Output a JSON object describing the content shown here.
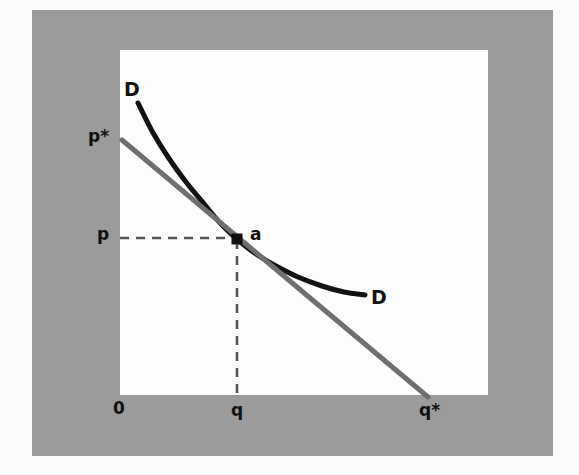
{
  "figure": {
    "kind": "economics-diagram",
    "colors": {
      "page_background": "#fcfcfc",
      "mat_gray": "#9b9b9b",
      "panel_white": "#fdfdfd",
      "demand_curve": "#121212",
      "tangent_line": "#6f6f6f",
      "dashed_guide": "#555555",
      "marker": "#111111",
      "label_text": "#111111"
    },
    "panel": {
      "left": 120,
      "top": 50,
      "width": 368,
      "height": 345
    },
    "mat": {
      "left": 32,
      "top": 10,
      "width": 521,
      "height": 446
    }
  },
  "labels": [
    {
      "name": "curve-label-top",
      "text": "D",
      "x": 124,
      "y": 80,
      "size": "lbl-lg"
    },
    {
      "name": "curve-label-bottom",
      "text": "D",
      "x": 371,
      "y": 288,
      "size": "lbl-lg"
    },
    {
      "name": "axis-label-p-star",
      "text": "p*",
      "x": 88,
      "y": 128,
      "size": "lbl-md"
    },
    {
      "name": "axis-label-p",
      "text": "p",
      "x": 97,
      "y": 226,
      "size": "lbl-md"
    },
    {
      "name": "point-label-a",
      "text": "a",
      "x": 250,
      "y": 226,
      "size": "lbl-md"
    },
    {
      "name": "axis-label-origin",
      "text": "0",
      "x": 113,
      "y": 400,
      "size": "lbl-md"
    },
    {
      "name": "axis-label-q",
      "text": "q",
      "x": 231,
      "y": 402,
      "size": "lbl-md"
    },
    {
      "name": "axis-label-q-star",
      "text": "q*",
      "x": 419,
      "y": 402,
      "size": "lbl-md"
    }
  ],
  "chart_data": {
    "type": "line",
    "title": "",
    "xlabel": "",
    "ylabel": "",
    "grid": false,
    "legend_position": "inline-endpoint-labels",
    "annotations": [
      {
        "label": "D",
        "role": "demand-curve-upper-end",
        "at": [
          138,
          103
        ]
      },
      {
        "label": "D",
        "role": "demand-curve-lower-end",
        "at": [
          365,
          295
        ]
      },
      {
        "label": "a",
        "role": "tangency-point",
        "at": [
          237,
          239
        ]
      },
      {
        "label": "p",
        "role": "price-at-tangency",
        "at": [
          120,
          237
        ]
      },
      {
        "label": "q",
        "role": "quantity-at-tangency",
        "at": [
          237,
          395
        ]
      },
      {
        "label": "p*",
        "role": "tangent-price-intercept",
        "at": [
          122,
          140
        ]
      },
      {
        "label": "q*",
        "role": "tangent-quantity-intercept",
        "at": [
          428,
          397
        ]
      },
      {
        "label": "0",
        "role": "origin",
        "at": [
          120,
          395
        ]
      }
    ],
    "series": [
      {
        "name": "D",
        "role": "demand-curve",
        "type": "curve",
        "color": "#121212",
        "width": 5,
        "points": [
          [
            138,
            103
          ],
          [
            152,
            131
          ],
          [
            168,
            157
          ],
          [
            186,
            182
          ],
          [
            205,
            205
          ],
          [
            221,
            224
          ],
          [
            237,
            239
          ],
          [
            256,
            254
          ],
          [
            276,
            266
          ],
          [
            298,
            277
          ],
          [
            322,
            286
          ],
          [
            344,
            292
          ],
          [
            365,
            295
          ]
        ]
      },
      {
        "name": "tangent",
        "role": "tangent-line-at-a",
        "type": "straight",
        "color": "#6f6f6f",
        "width": 5,
        "points": [
          [
            122,
            140
          ],
          [
            428,
            397
          ]
        ]
      }
    ],
    "guides": [
      {
        "name": "price-guide",
        "orientation": "horizontal",
        "style": "dashed",
        "color": "#555555",
        "from": [
          120,
          238
        ],
        "to": [
          237,
          238
        ]
      },
      {
        "name": "quantity-guide",
        "orientation": "vertical",
        "style": "dashed",
        "color": "#555555",
        "from": [
          237,
          240
        ],
        "to": [
          237,
          396
        ]
      }
    ],
    "markers": [
      {
        "name": "tangency-marker",
        "shape": "square",
        "at": [
          237,
          239
        ],
        "size": 11,
        "color": "#111111"
      }
    ]
  }
}
